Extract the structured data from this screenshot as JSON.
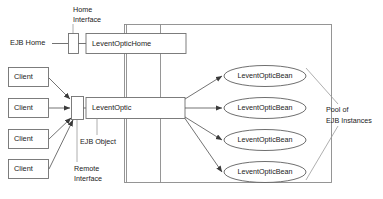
{
  "diagram": {
    "type": "architecture-diagram",
    "colors": {
      "stroke": "#6f6f6f",
      "text": "#1a1a1a",
      "background": "#ffffff",
      "container_stroke": "#8a8a8a"
    },
    "annotations": {
      "home_interface": "Home\nInterface",
      "home_interface_line1": "Home",
      "home_interface_line2": "Interface",
      "remote_interface_line1": "Remote",
      "remote_interface_line2": "Interface",
      "ejb_object": "EJB Object",
      "pool_line1": "Pool of",
      "pool_line2": "EJB Instances"
    },
    "nodes": {
      "ejb_home_label": "EJB Home",
      "home_bean_label": "LeventOpticHome",
      "remote_bean_label": "LeventOptic"
    },
    "clients": [
      {
        "label": "Client"
      },
      {
        "label": "Client"
      },
      {
        "label": "Client"
      },
      {
        "label": "Client"
      }
    ],
    "pool_beans": [
      {
        "label": "LeventOpticBean"
      },
      {
        "label": "LeventOpticBean"
      },
      {
        "label": "LeventOpticBean"
      },
      {
        "label": "LeventOpticBean"
      }
    ]
  }
}
